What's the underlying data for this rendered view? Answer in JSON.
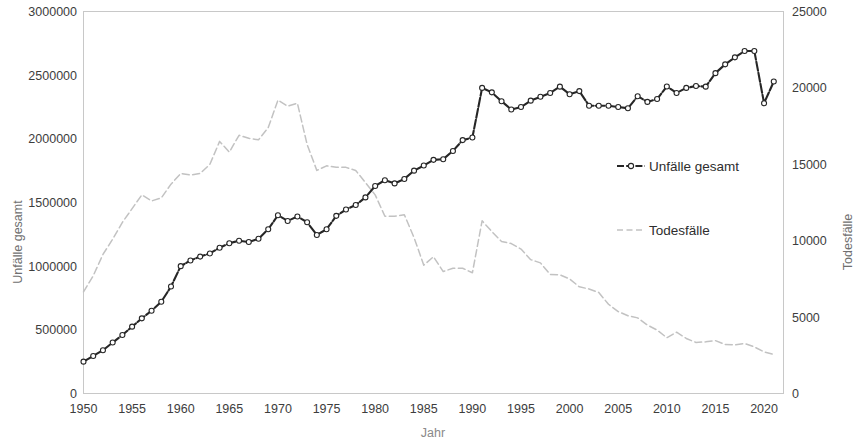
{
  "chart_data": {
    "type": "line",
    "title": "",
    "xlabel": "Jahr",
    "ylabel": "Unfälle gesamt",
    "y2label": "Todesfälle",
    "grid": false,
    "legend_position": "inside-right",
    "xlim": [
      1950,
      2022
    ],
    "ylim": [
      0,
      3000000
    ],
    "y2lim": [
      0,
      25000
    ],
    "xticks": [
      1950,
      1955,
      1960,
      1965,
      1970,
      1975,
      1980,
      1985,
      1990,
      1995,
      2000,
      2005,
      2010,
      2015,
      2020
    ],
    "yticks": [
      0,
      500000,
      1000000,
      1500000,
      2000000,
      2500000,
      3000000
    ],
    "y2ticks": [
      0,
      5000,
      10000,
      15000,
      20000,
      25000
    ],
    "xtick_labels": [
      "1950",
      "1955",
      "1960",
      "1965",
      "1970",
      "1975",
      "1980",
      "1985",
      "1990",
      "1995",
      "2000",
      "2005",
      "2010",
      "2015",
      "2020"
    ],
    "ytick_labels": [
      "0",
      "500000",
      "1000000",
      "1500000",
      "2000000",
      "2500000",
      "3000000"
    ],
    "y2tick_labels": [
      "0",
      "5000",
      "10000",
      "15000",
      "20000",
      "25000"
    ],
    "x": [
      1950,
      1951,
      1952,
      1953,
      1954,
      1955,
      1956,
      1957,
      1958,
      1959,
      1960,
      1961,
      1962,
      1963,
      1964,
      1965,
      1966,
      1967,
      1968,
      1969,
      1970,
      1971,
      1972,
      1973,
      1974,
      1975,
      1976,
      1977,
      1978,
      1979,
      1980,
      1981,
      1982,
      1983,
      1984,
      1985,
      1986,
      1987,
      1988,
      1989,
      1990,
      1991,
      1992,
      1993,
      1994,
      1995,
      1996,
      1997,
      1998,
      1999,
      2000,
      2001,
      2002,
      2003,
      2004,
      2005,
      2006,
      2007,
      2008,
      2009,
      2010,
      2011,
      2012,
      2013,
      2014,
      2015,
      2016,
      2017,
      2018,
      2019,
      2020,
      2021
    ],
    "series": [
      {
        "name": "Unfälle gesamt",
        "axis": "left",
        "color": "#262626",
        "style": "dashed-with-markers",
        "values": [
          250000,
          295000,
          340000,
          400000,
          460000,
          525000,
          590000,
          650000,
          720000,
          840000,
          1000000,
          1045000,
          1075000,
          1100000,
          1145000,
          1180000,
          1200000,
          1190000,
          1215000,
          1290000,
          1400000,
          1355000,
          1390000,
          1345000,
          1245000,
          1290000,
          1395000,
          1445000,
          1480000,
          1540000,
          1630000,
          1675000,
          1650000,
          1685000,
          1750000,
          1790000,
          1835000,
          1840000,
          1905000,
          1990000,
          2010000,
          2400000,
          2365000,
          2295000,
          2230000,
          2250000,
          2300000,
          2330000,
          2360000,
          2410000,
          2350000,
          2375000,
          2260000,
          2260000,
          2260000,
          2250000,
          2240000,
          2335000,
          2290000,
          2313000,
          2411000,
          2360000,
          2400000,
          2415000,
          2410000,
          2516000,
          2585000,
          2640000,
          2690000,
          2690000,
          2280000,
          2450000
        ]
      },
      {
        "name": "Todesfälle",
        "axis": "right",
        "color": "#c2c2c2",
        "style": "dashed",
        "values": [
          6650,
          7700,
          9100,
          10100,
          11200,
          12100,
          13000,
          12600,
          12800,
          13700,
          14400,
          14300,
          14400,
          15000,
          16500,
          15800,
          16900,
          16700,
          16600,
          17400,
          19200,
          18800,
          19000,
          16300,
          14600,
          14900,
          14800,
          14800,
          14600,
          13800,
          13000,
          11600,
          11600,
          11700,
          10200,
          8400,
          8950,
          7980,
          8200,
          8200,
          7900,
          11300,
          10600,
          9950,
          9810,
          9450,
          8760,
          8550,
          7790,
          7770,
          7500,
          6980,
          6840,
          6610,
          5840,
          5360,
          5090,
          4950,
          4480,
          4150,
          3650,
          4010,
          3600,
          3340,
          3380,
          3460,
          3210,
          3180,
          3270,
          3050,
          2720,
          2560
        ]
      }
    ]
  },
  "axes": {
    "left_title": "Unfälle gesamt",
    "right_title": "Todesfälle",
    "bottom_title": "Jahr"
  },
  "legend": {
    "items": [
      {
        "label": "Unfälle gesamt",
        "marker": "line-with-circle-marker"
      },
      {
        "label": "Todesfälle",
        "marker": "dashed-line"
      }
    ]
  },
  "colors": {
    "accidents": "#262626",
    "deaths": "#c2c2c2",
    "border": "#c8c8c8",
    "tick_text": "#3d3d3d",
    "axis_title": "#8a8a8a",
    "background": "#ffffff"
  }
}
